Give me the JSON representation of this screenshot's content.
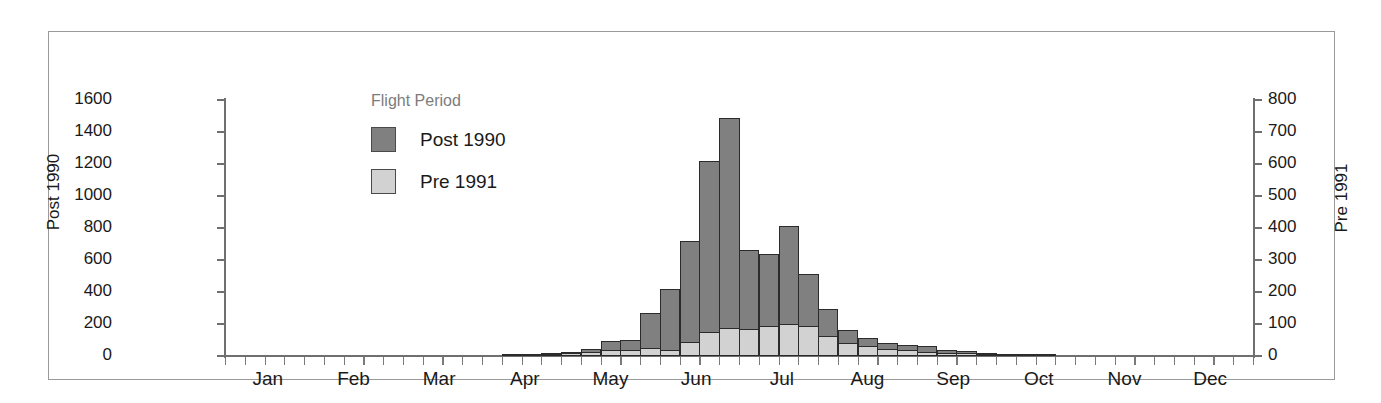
{
  "chart_data": {
    "type": "bar",
    "title": "",
    "subtitle": "",
    "xlabel": "",
    "ylabel": "Post 1990",
    "y2label": "Pre 1991",
    "ylim": [
      0,
      1600
    ],
    "y2lim": [
      0,
      800
    ],
    "grid": false,
    "legend_position": "inside-top-left",
    "legend_title": "Flight Period",
    "bin": "week",
    "x_tick_labels": [
      "Jan",
      "Feb",
      "Mar",
      "Apr",
      "May",
      "Jun",
      "Jul",
      "Aug",
      "Sep",
      "Oct",
      "Nov",
      "Dec"
    ],
    "y_tick_labels": [
      "0",
      "200",
      "400",
      "600",
      "800",
      "1000",
      "1200",
      "1400",
      "1600"
    ],
    "y_tick_values": [
      0,
      200,
      400,
      600,
      800,
      1000,
      1200,
      1400,
      1600
    ],
    "y2_tick_labels": [
      "0",
      "100",
      "200",
      "300",
      "400",
      "500",
      "600",
      "700",
      "800"
    ],
    "y2_tick_values": [
      0,
      100,
      200,
      300,
      400,
      500,
      600,
      700,
      800
    ],
    "series": [
      {
        "name": "Post 1990",
        "axis": "left",
        "color": "#808080",
        "values": [
          0,
          0,
          0,
          0,
          0,
          0,
          0,
          0,
          0,
          0,
          0,
          0,
          0,
          0,
          15,
          12,
          18,
          22,
          45,
          95,
          100,
          270,
          420,
          720,
          1220,
          1490,
          660,
          640,
          815,
          515,
          295,
          165,
          110,
          80,
          70,
          60,
          40,
          30,
          20,
          15,
          10,
          8,
          0,
          0,
          0,
          0,
          0,
          0,
          0,
          0,
          0,
          0
        ]
      },
      {
        "name": "Pre 1991",
        "axis": "right",
        "color": "#d2d2d2",
        "values": [
          0,
          0,
          0,
          0,
          0,
          0,
          0,
          0,
          0,
          0,
          0,
          0,
          0,
          0,
          3,
          4,
          6,
          8,
          12,
          18,
          20,
          26,
          20,
          45,
          75,
          88,
          85,
          95,
          100,
          95,
          62,
          40,
          30,
          22,
          18,
          14,
          10,
          8,
          5,
          4,
          3,
          2,
          0,
          0,
          0,
          0,
          0,
          0,
          0,
          0,
          0,
          0
        ]
      }
    ],
    "weeks": 52
  },
  "legend": {
    "title": "Flight Period",
    "entries": [
      {
        "label": "Post 1990",
        "color": "#808080"
      },
      {
        "label": "Pre 1991",
        "color": "#d2d2d2"
      }
    ]
  },
  "axes": {
    "left_title": "Post 1990",
    "right_title": "Pre 1991"
  }
}
